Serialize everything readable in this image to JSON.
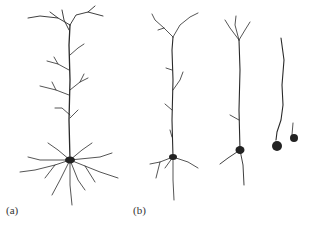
{
  "figure": {
    "panels": [
      {
        "label": "(a)",
        "description": "Healthy pyramidal neuron with extensive dendritic arbor"
      },
      {
        "label": "(b)",
        "description": "Progressive dendritic degeneration of pyramidal neurons (three stages)"
      }
    ]
  }
}
